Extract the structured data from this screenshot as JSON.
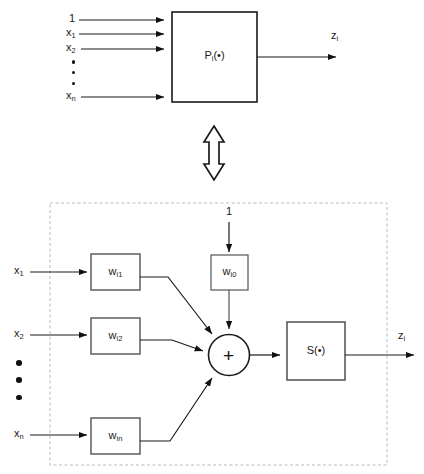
{
  "figure": {
    "colors": {
      "stroke": "#1a1a1a",
      "dashed_group": "#b9b9b9",
      "background": "#ffffff"
    }
  },
  "top_block": {
    "box_label": "P",
    "box_label_sub": "i",
    "box_label_tail": "(•)",
    "inputs": [
      {
        "label": "1",
        "sub": ""
      },
      {
        "label": "x",
        "sub": "1"
      },
      {
        "label": "x",
        "sub": "2"
      },
      {
        "label": "x",
        "sub": "n"
      }
    ],
    "dots_icon": "vertical-ellipsis",
    "output": {
      "label": "z",
      "sub": "i"
    }
  },
  "equivalence": {
    "icon": "double-headed-vertical-arrow",
    "meaning": "is equivalent to"
  },
  "bottom_block": {
    "group_border": "dashed",
    "bias_input": {
      "label": "1",
      "sub": ""
    },
    "bias_weight": {
      "label": "w",
      "sub": "i0"
    },
    "inputs": [
      {
        "label": "x",
        "sub": "1"
      },
      {
        "label": "x",
        "sub": "2"
      },
      {
        "label": "x",
        "sub": "n"
      }
    ],
    "dots_icon": "vertical-ellipsis",
    "weights": [
      {
        "label": "w",
        "sub": "i1"
      },
      {
        "label": "w",
        "sub": "i2"
      },
      {
        "label": "w",
        "sub": "in"
      }
    ],
    "summation": {
      "symbol": "+",
      "name": "summing-junction"
    },
    "activation": {
      "label": "S",
      "tail": "(•)"
    },
    "output": {
      "label": "z",
      "sub": "i"
    }
  }
}
